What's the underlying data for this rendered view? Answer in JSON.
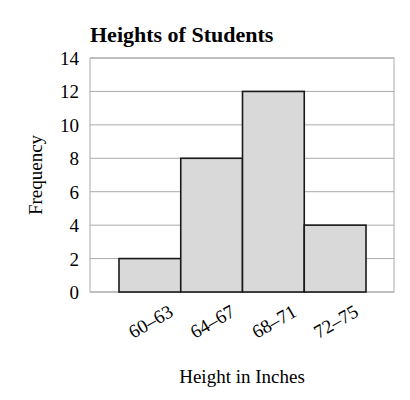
{
  "chart_data": {
    "type": "bar",
    "title": "Heights of Students",
    "xlabel": "Height in Inches",
    "ylabel": "Frequency",
    "categories": [
      "60–63",
      "64–67",
      "68–71",
      "72–75"
    ],
    "values": [
      2,
      8,
      12,
      4
    ],
    "ylim": [
      0,
      14
    ],
    "yticks": [
      0,
      2,
      4,
      6,
      8,
      10,
      12,
      14
    ],
    "grid": true,
    "legend": null,
    "bar_color": "#d9d9d9",
    "bar_edge_color": "#1a1a1a",
    "grid_color": "#aaaaaa"
  }
}
